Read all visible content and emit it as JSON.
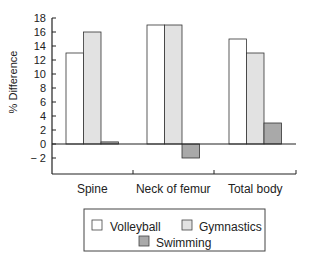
{
  "chart_data": {
    "type": "bar",
    "title": "",
    "xlabel": "",
    "ylabel": "% Difference",
    "ylim": [
      -4,
      18
    ],
    "yticks": [
      -2,
      0,
      2,
      4,
      6,
      8,
      10,
      12,
      14,
      16,
      18
    ],
    "ytick_labels": [
      "− 2",
      "0",
      "2",
      "4",
      "6",
      "8",
      "10",
      "12",
      "14",
      "16",
      "18"
    ],
    "categories": [
      "Spine",
      "Neck of femur",
      "Total body"
    ],
    "series": [
      {
        "name": "Volleyball",
        "values": [
          13,
          17,
          15
        ],
        "color": "#ffffff"
      },
      {
        "name": "Gymnastics",
        "values": [
          16,
          17,
          13
        ],
        "color": "#e2e2e2"
      },
      {
        "name": "Swimming",
        "values": [
          0.3,
          -2,
          3
        ],
        "color": "#a9a9a9"
      }
    ],
    "grid": false,
    "legend_position": "bottom"
  },
  "legend": {
    "items": [
      "Volleyball",
      "Gymnastics",
      "Swimming"
    ]
  }
}
